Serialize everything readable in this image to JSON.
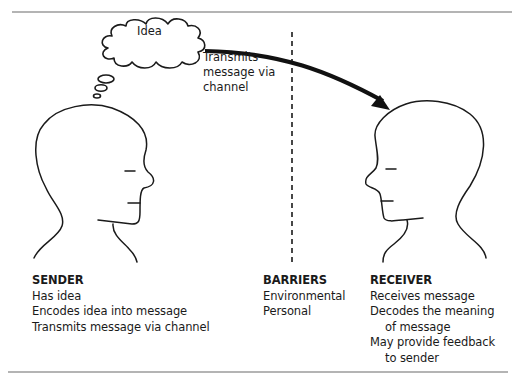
{
  "diagram": {
    "type": "communication-process",
    "thought_bubble": {
      "label": "Idea"
    },
    "arrow": {
      "label_lines": [
        "Transmits",
        "message via",
        "channel"
      ]
    },
    "sender": {
      "heading": "SENDER",
      "items": [
        "Has idea",
        "Encodes idea into message",
        "Transmits message via channel"
      ]
    },
    "barriers": {
      "heading": "BARRIERS",
      "items": [
        "Environmental",
        "Personal"
      ]
    },
    "receiver": {
      "heading": "RECEIVER",
      "items": [
        "Receives message",
        "Decodes the meaning",
        "of message",
        "May provide feedback",
        "to sender"
      ]
    },
    "colors": {
      "stroke": "#1a1a1a",
      "rule": "#555555",
      "background": "#ffffff"
    }
  }
}
